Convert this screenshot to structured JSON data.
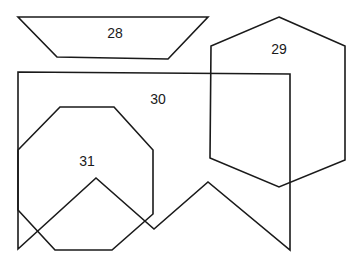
{
  "diagram": {
    "background": "#ffffff",
    "stroke_color": "#1a1a1a",
    "shapes": [
      {
        "id": "28",
        "label": "28",
        "kind": "trapezoid",
        "points": "18,17 208,17 168,59 57,57",
        "label_pos": [
          115,
          34
        ]
      },
      {
        "id": "29",
        "label": "29",
        "kind": "hexagon",
        "points": "279,17 345,46 345,160 279,187 210,158 211,46",
        "label_pos": [
          279,
          50
        ]
      },
      {
        "id": "30",
        "label": "30",
        "kind": "rectangle-with-zigzag-bottom",
        "points": "18,72 290,74 290,250 208,182 154,229 96,178 18,249",
        "label_pos": [
          158,
          100
        ]
      },
      {
        "id": "31",
        "label": "31",
        "kind": "octagon",
        "points": "60,107 114,107 153,150 153,214 112,250 55,250 18,210 18,150",
        "label_pos": [
          87,
          162
        ]
      }
    ]
  }
}
